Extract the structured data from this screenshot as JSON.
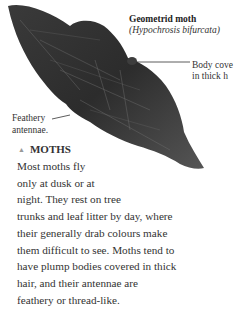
{
  "figure": {
    "title": "Geometrid moth",
    "subtitle": "(Hypochrosis bifurcata)",
    "callouts": {
      "body": [
        "Body cove",
        "in thick h"
      ],
      "antennae": [
        "Feathery",
        "antennae."
      ]
    }
  },
  "section": {
    "icon": "triangle-up-icon",
    "heading": "MOTHS",
    "lines": [
      "Most moths fly",
      "only at dusk or at",
      "night. They rest on tree",
      "trunks and leaf litter by day, where",
      "their generally drab colours make",
      "them difficult to see. Moths tend to",
      "have plump bodies covered in thick",
      "hair, and their antennae are",
      "feathery or thread-like."
    ]
  },
  "colors": {
    "moth_dark": "#2b2b2b",
    "moth_mid": "#4a4a4a",
    "text": "#333333",
    "accent_triangle": "#999999"
  }
}
